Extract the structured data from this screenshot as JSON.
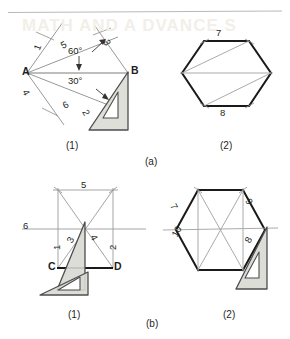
{
  "page": {
    "header_rule": true,
    "ghost_text": "MATH AND A DVANCE S"
  },
  "captions": {
    "top_sub_left": "(1)",
    "top_sub_right": "(2)",
    "top_group": "(a)",
    "bottom_sub_left": "(1)",
    "bottom_sub_right": "(2)",
    "bottom_group": "(b)"
  },
  "figure_a1": {
    "name": "hexagon-across-corners-construction",
    "vertex_labels": [
      {
        "text": "A",
        "x": 22,
        "y": 68
      },
      {
        "text": "B",
        "x": 131,
        "y": 67
      }
    ],
    "step_numbers": [
      {
        "text": "1",
        "x": 32,
        "y": 48
      },
      {
        "text": "5",
        "x": 60,
        "y": 40
      },
      {
        "text": "3",
        "x": 112,
        "y": 41
      },
      {
        "text": "4",
        "x": 30,
        "y": 89
      },
      {
        "text": "6",
        "x": 62,
        "y": 103
      },
      {
        "text": "2",
        "x": 91,
        "y": 112
      }
    ],
    "angles": [
      {
        "text": "60°",
        "x": 74,
        "y": 50
      },
      {
        "text": "30°",
        "x": 73,
        "y": 78
      }
    ]
  },
  "figure_a2": {
    "name": "hexagon-across-corners-result",
    "step_numbers": [
      {
        "text": "7",
        "x": 216,
        "y": 28
      },
      {
        "text": "8",
        "x": 222,
        "y": 110
      }
    ]
  },
  "figure_b1": {
    "name": "hexagon-across-flats-construction",
    "vertex_labels": [
      {
        "text": "C",
        "x": 50,
        "y": 262
      },
      {
        "text": "D",
        "x": 114,
        "y": 262
      }
    ],
    "step_numbers": [
      {
        "text": "5",
        "x": 82,
        "y": 182
      },
      {
        "text": "6",
        "x": 24,
        "y": 222
      },
      {
        "text": "4",
        "x": 97,
        "y": 235
      },
      {
        "text": "3",
        "x": 66,
        "y": 238
      },
      {
        "text": "1",
        "x": 53,
        "y": 244
      },
      {
        "text": "2",
        "x": 109,
        "y": 243
      }
    ]
  },
  "figure_b2": {
    "name": "hexagon-across-flats-result",
    "step_numbers": [
      {
        "text": "9",
        "x": 252,
        "y": 199
      },
      {
        "text": "7",
        "x": 177,
        "y": 204
      },
      {
        "text": "10",
        "x": 173,
        "y": 239
      },
      {
        "text": "8",
        "x": 245,
        "y": 245
      }
    ]
  },
  "colors": {
    "ink": "#231f20",
    "construction_line": "#8c8c8c",
    "heavy_line": "#1a1a1a",
    "set_square_fill": "#d9d9d4",
    "set_square_edge": "#555555",
    "rule": "#b9b9b9",
    "ghost": "#f2efe9"
  }
}
